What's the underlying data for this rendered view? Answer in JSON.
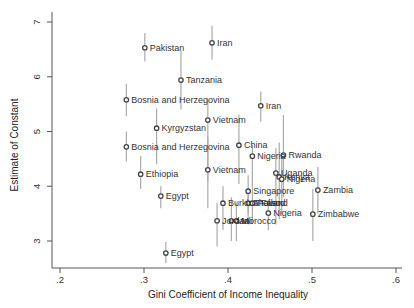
{
  "chart_data": {
    "type": "scatter",
    "title": "",
    "xlabel": "Gini Coefficient of Income Inequality",
    "ylabel": "Estimate of Constant",
    "xlim": [
      0.2,
      0.6
    ],
    "ylim": [
      2.5,
      7.0
    ],
    "x_ticks": [
      ".2",
      ".3",
      ".4",
      ".5",
      ".6"
    ],
    "x_tick_values": [
      0.2,
      0.3,
      0.4,
      0.5,
      0.6
    ],
    "y_ticks": [
      "3",
      "4",
      "5",
      "6",
      "7"
    ],
    "y_tick_values": [
      3,
      4,
      5,
      6,
      7
    ],
    "grid": false,
    "error_bars": true,
    "points": [
      {
        "label": "Pakistan",
        "x": 0.301,
        "y": 6.53,
        "lo": 6.28,
        "hi": 6.8
      },
      {
        "label": "Iran",
        "x": 0.381,
        "y": 6.62,
        "lo": 6.31,
        "hi": 6.93
      },
      {
        "label": "Tanzania",
        "x": 0.344,
        "y": 5.94,
        "lo": 5.4,
        "hi": 6.47
      },
      {
        "label": "Bosnia and Herzegovina",
        "x": 0.279,
        "y": 5.58,
        "lo": 5.28,
        "hi": 5.87
      },
      {
        "label": "Kyrgyzstan",
        "x": 0.315,
        "y": 5.06,
        "lo": 4.4,
        "hi": 5.42
      },
      {
        "label": "Vietnam",
        "x": 0.376,
        "y": 5.21,
        "lo": 4.1,
        "hi": 5.58
      },
      {
        "label": "Iran",
        "x": 0.439,
        "y": 5.47,
        "lo": 5.18,
        "hi": 5.73
      },
      {
        "label": "China",
        "x": 0.413,
        "y": 4.75,
        "lo": 4.04,
        "hi": 5.31
      },
      {
        "label": "Nigeria",
        "x": 0.429,
        "y": 4.55,
        "lo": 3.95,
        "hi": 4.75
      },
      {
        "label": "Rwanda",
        "x": 0.466,
        "y": 4.57,
        "lo": 3.8,
        "hi": 5.3
      },
      {
        "label": "Bosnia and Herzegovina",
        "x": 0.279,
        "y": 4.72,
        "lo": 4.45,
        "hi": 5.0
      },
      {
        "label": "Vietnam",
        "x": 0.376,
        "y": 4.3,
        "lo": 3.6,
        "hi": 4.9
      },
      {
        "label": "Ethiopia",
        "x": 0.296,
        "y": 4.22,
        "lo": 3.95,
        "hi": 4.55
      },
      {
        "label": "Uganda",
        "x": 0.457,
        "y": 4.24,
        "lo": 3.3,
        "hi": 4.7
      },
      {
        "label": "Kenya",
        "x": 0.461,
        "y": 4.17,
        "lo": 3.4,
        "hi": 4.8
      },
      {
        "label": "Nigeria",
        "x": 0.464,
        "y": 4.13,
        "lo": 3.5,
        "hi": 4.6
      },
      {
        "label": "Egypt",
        "x": 0.32,
        "y": 3.82,
        "lo": 3.6,
        "hi": 4.0
      },
      {
        "label": "Singapore",
        "x": 0.424,
        "y": 3.91,
        "lo": 3.5,
        "hi": 4.2
      },
      {
        "label": "Burkina Faso",
        "x": 0.394,
        "y": 3.69,
        "lo": 3.2,
        "hi": 4.0
      },
      {
        "label": "Thailand",
        "x": 0.424,
        "y": 3.69,
        "lo": 3.3,
        "hi": 3.95
      },
      {
        "label": "Poland",
        "x": 0.429,
        "y": 3.69,
        "lo": 3.4,
        "hi": 3.95
      },
      {
        "label": "Zambia",
        "x": 0.507,
        "y": 3.93,
        "lo": 3.5,
        "hi": 4.35
      },
      {
        "label": "Nigeria",
        "x": 0.448,
        "y": 3.51,
        "lo": 3.2,
        "hi": 3.75
      },
      {
        "label": "Zimbabwe",
        "x": 0.501,
        "y": 3.49,
        "lo": 3.0,
        "hi": 3.95
      },
      {
        "label": "Jordan",
        "x": 0.387,
        "y": 3.37,
        "lo": 2.9,
        "hi": 3.7
      },
      {
        "label": "Mali",
        "x": 0.404,
        "y": 3.37,
        "lo": 3.0,
        "hi": 3.8
      },
      {
        "label": "Morocco",
        "x": 0.41,
        "y": 3.37,
        "lo": 3.0,
        "hi": 3.7
      },
      {
        "label": "Egypt",
        "x": 0.326,
        "y": 2.78,
        "lo": 2.6,
        "hi": 2.98
      }
    ]
  },
  "colors": {
    "point": "#444444",
    "bar": "#aaaaaa",
    "axis": "#555555",
    "text": "#333333"
  }
}
